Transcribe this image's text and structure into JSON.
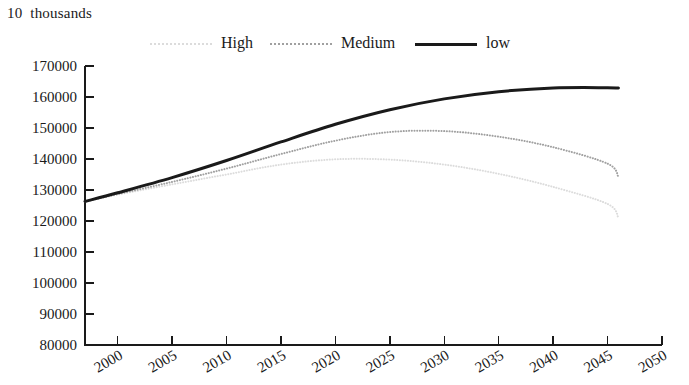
{
  "caption": "10  thousands",
  "legend": {
    "position": "top-center",
    "entries": [
      {
        "label": "High",
        "key": "high",
        "color": "#dcdcdc",
        "style": "dotted",
        "width": 2
      },
      {
        "label": "Medium",
        "key": "medium",
        "color": "#a0a0a0",
        "style": "dotted",
        "width": 2
      },
      {
        "label": "low",
        "key": "low",
        "color": "#1a1a1a",
        "style": "solid",
        "width": 3
      }
    ]
  },
  "chart_data": {
    "type": "line",
    "title": "",
    "subtitle": "",
    "xlabel": "",
    "ylabel": "10  thousands",
    "xlim": [
      1997,
      2050
    ],
    "ylim": [
      80000,
      170000
    ],
    "grid": false,
    "legend_position": "top-center",
    "xticks": [
      "2000",
      "2005",
      "2010",
      "2015",
      "2020",
      "2025",
      "2030",
      "2035",
      "2040",
      "2045",
      "2050"
    ],
    "xtick_values": [
      2000,
      2005,
      2010,
      2015,
      2020,
      2025,
      2030,
      2035,
      2040,
      2045,
      2050
    ],
    "yticks": [
      "80000",
      "90000",
      "100000",
      "110000",
      "120000",
      "130000",
      "140000",
      "150000",
      "160000",
      "170000"
    ],
    "ytick_values": [
      80000,
      90000,
      100000,
      110000,
      120000,
      130000,
      140000,
      150000,
      160000,
      170000
    ],
    "x": [
      1997,
      2000,
      2005,
      2010,
      2015,
      2020,
      2025,
      2030,
      2035,
      2040,
      2045,
      2046
    ],
    "series": [
      {
        "name": "High",
        "color": "#dcdcdc",
        "style": "dotted",
        "width": 2,
        "values": [
          126300,
          128500,
          131800,
          135000,
          138200,
          139900,
          139800,
          138200,
          135200,
          131000,
          125500,
          121000
        ]
      },
      {
        "name": "Medium",
        "color": "#a0a0a0",
        "style": "dotted",
        "width": 2,
        "values": [
          126300,
          128700,
          132600,
          136900,
          141600,
          145900,
          148700,
          149000,
          147200,
          143800,
          138500,
          134200
        ]
      },
      {
        "name": "low",
        "color": "#1a1a1a",
        "style": "solid",
        "width": 3,
        "values": [
          126300,
          129100,
          134000,
          139500,
          145500,
          151200,
          155900,
          159400,
          161700,
          162900,
          163000,
          162900
        ]
      }
    ]
  }
}
